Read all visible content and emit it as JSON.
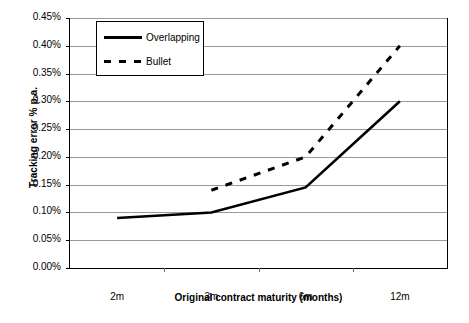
{
  "chart_data": {
    "type": "line",
    "title": "",
    "xlabel": "Original contract maturity (months)",
    "ylabel": "Tracking error % p.a.",
    "categories": [
      "2m",
      "3m",
      "6m",
      "12m"
    ],
    "ylim": [
      0.0,
      0.45
    ],
    "ytick_labels": [
      "0.45%",
      "0.40%",
      "0.35%",
      "0.30%",
      "0.25%",
      "0.20%",
      "0.15%",
      "0.10%",
      "0.05%",
      "0.00%"
    ],
    "ytick_values": [
      0.45,
      0.4,
      0.35,
      0.3,
      0.25,
      0.2,
      0.15,
      0.1,
      0.05,
      0.0
    ],
    "grid": true,
    "legend_position": "top-left-inside",
    "series": [
      {
        "name": "Overlapping",
        "style": "solid",
        "color": "#000000",
        "values": [
          0.09,
          0.1,
          0.145,
          0.3
        ]
      },
      {
        "name": "Bullet",
        "style": "dashed",
        "color": "#000000",
        "values": [
          null,
          0.14,
          0.2,
          0.4
        ]
      }
    ]
  },
  "legend": {
    "items": [
      {
        "label": "Overlapping",
        "swatch": "solid-line-swatch"
      },
      {
        "label": "Bullet",
        "swatch": "dashed-line-swatch"
      }
    ]
  }
}
